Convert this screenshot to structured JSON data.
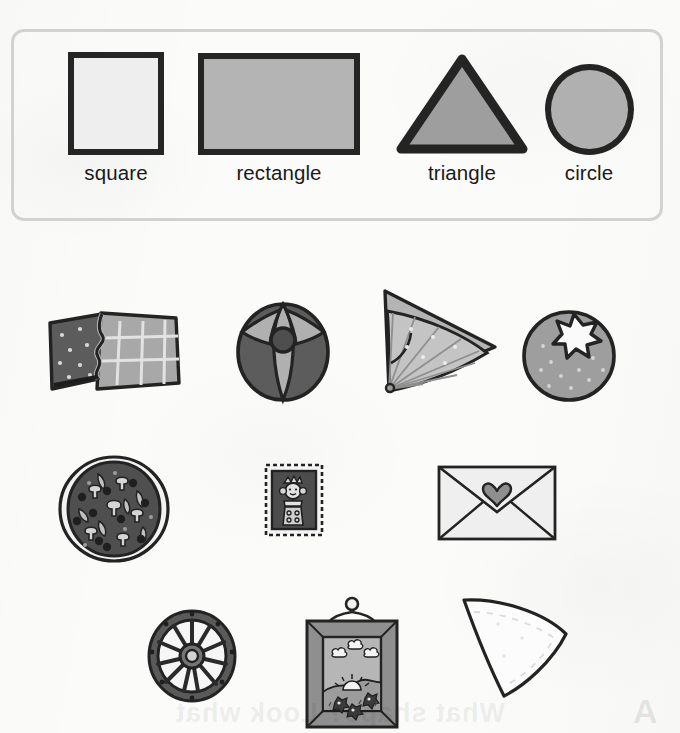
{
  "worksheet": {
    "title": "Shapes identification worksheet",
    "bleed_through_text": "What shape? Look what",
    "bleed_through_mark": "A"
  },
  "key": {
    "label": "shape key",
    "items": [
      {
        "name": "square",
        "shape": "square",
        "fill": "#eeeeee",
        "stroke": "#252525"
      },
      {
        "name": "rectangle",
        "shape": "rectangle",
        "fill": "#b4b4b4",
        "stroke": "#252525"
      },
      {
        "name": "triangle",
        "shape": "triangle",
        "fill": "#9e9e9e",
        "stroke": "#242424"
      },
      {
        "name": "circle",
        "shape": "circle",
        "fill": "#b0b0b0",
        "stroke": "#242424"
      }
    ]
  },
  "objects": {
    "label": "objects to match",
    "rows": [
      {
        "row": 1,
        "items": [
          {
            "object": "chocolate bar",
            "shape": "rectangle",
            "alt": "partly unwrapped chocolate bar"
          },
          {
            "object": "beach ball",
            "shape": "circle",
            "alt": "striped beach ball"
          },
          {
            "object": "folding fan",
            "shape": "triangle",
            "alt": "open folding fan"
          },
          {
            "object": "tomato",
            "shape": "circle",
            "alt": "tomato with star stem"
          }
        ]
      },
      {
        "row": 2,
        "items": [
          {
            "object": "pizza",
            "shape": "circle",
            "alt": "mushroom pizza"
          },
          {
            "object": "stamp",
            "shape": "rectangle",
            "alt": "postage stamp with queen"
          },
          {
            "object": "envelope",
            "shape": "rectangle",
            "alt": "envelope with heart seal"
          }
        ]
      },
      {
        "row": 3,
        "items": [
          {
            "object": "wagon wheel",
            "shape": "circle",
            "alt": "spoked wagon wheel"
          },
          {
            "object": "picture frame",
            "shape": "square",
            "alt": "hanging framed landscape picture"
          },
          {
            "object": "triangle pennant",
            "shape": "triangle",
            "alt": "white triangular cloth"
          }
        ]
      }
    ]
  },
  "palette": {
    "ink": "#232323",
    "dark_grey": "#5e5e5e",
    "mid_grey": "#9e9e9e",
    "light_grey": "#c9c9c9",
    "pale": "#ececec",
    "box_border": "#d2d2d2",
    "paper": "#fbfbf9"
  }
}
